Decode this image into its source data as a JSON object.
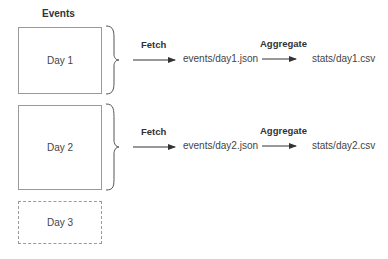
{
  "header": {
    "title": "Events"
  },
  "rows": [
    {
      "day": "Day 1",
      "fetch_label": "Fetch",
      "json_file": "events/day1.json",
      "aggregate_label": "Aggregate",
      "csv_file": "stats/day1.csv"
    },
    {
      "day": "Day 2",
      "fetch_label": "Fetch",
      "json_file": "events/day2.json",
      "aggregate_label": "Aggregate",
      "csv_file": "stats/day2.csv"
    }
  ],
  "pending": {
    "day": "Day 3"
  },
  "colors": {
    "border": "#9a9a9a",
    "arrow": "#333333",
    "text": "#444444"
  }
}
